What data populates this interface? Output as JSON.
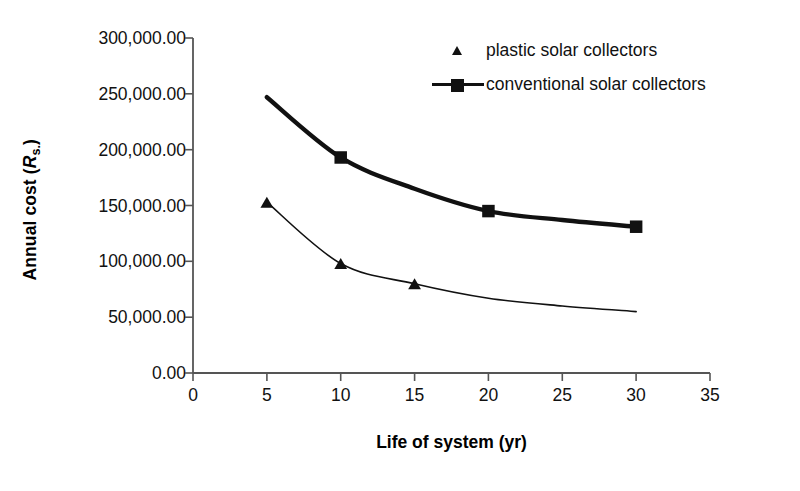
{
  "chart_data": {
    "type": "line",
    "title": "",
    "xlabel": "Life of system (yr)",
    "ylabel": "Annual cost (Rs.)",
    "ylabel_parts": {
      "prefix": "Annual cost (",
      "symbol": "R",
      "subscript": "s.",
      "suffix": ")"
    },
    "xlim": [
      0,
      35
    ],
    "ylim": [
      0,
      300000
    ],
    "xticks": [
      "0",
      "5",
      "10",
      "15",
      "20",
      "25",
      "30",
      "35"
    ],
    "xtick_values": [
      0,
      5,
      10,
      15,
      20,
      25,
      30,
      35
    ],
    "yticks": [
      "0.00",
      "50,000.00",
      "100,000.00",
      "150,000.00",
      "200,000.00",
      "250,000.00",
      "300,000.00"
    ],
    "ytick_values": [
      0,
      50000,
      100000,
      150000,
      200000,
      250000,
      300000
    ],
    "grid": false,
    "legend_position": "top-right",
    "series": [
      {
        "name": "plastic solar collectors",
        "marker": "triangle",
        "line_style": "thin",
        "line_width": 1.6,
        "color": "#111111",
        "x": [
          5,
          10,
          15,
          20,
          25,
          30
        ],
        "values": [
          153000,
          98000,
          80000,
          67000,
          60000,
          55000
        ],
        "marked_points": [
          {
            "x": 5,
            "y": 153000
          },
          {
            "x": 10,
            "y": 98000
          },
          {
            "x": 15,
            "y": 80000
          }
        ]
      },
      {
        "name": "conventional solar collectors",
        "marker": "square",
        "line_style": "thick",
        "line_width": 4.4,
        "color": "#111111",
        "x": [
          5,
          10,
          15,
          20,
          25,
          30
        ],
        "values": [
          247000,
          193000,
          165000,
          145000,
          137000,
          131000
        ],
        "marked_points": [
          {
            "x": 10,
            "y": 193000
          },
          {
            "x": 20,
            "y": 145000
          },
          {
            "x": 30,
            "y": 131000
          }
        ]
      }
    ]
  },
  "legend": {
    "entries": [
      {
        "label": "plastic solar collectors",
        "marker": "triangle-marker"
      },
      {
        "label": "conventional solar collectors",
        "marker": "line-square-marker"
      }
    ]
  },
  "colors": {
    "axis": "#555555",
    "series": "#111111",
    "background": "#ffffff"
  }
}
